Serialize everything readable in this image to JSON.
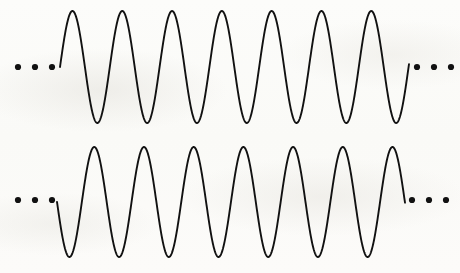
{
  "figure": {
    "background_color": "#fdfdfb",
    "stroke_color": "#111111",
    "stroke_width": 1.9,
    "width": 460,
    "height": 273
  },
  "chart_data": {
    "type": "line",
    "title": "",
    "subtitle": "",
    "xlabel": "",
    "ylabel": "",
    "xlim": [
      0,
      460
    ],
    "ylim": [
      273,
      0
    ],
    "grid": false,
    "legend": "none",
    "annotations": [
      {
        "name": "ellipsis-left-top",
        "text": "...",
        "dots": 3,
        "x": 18,
        "y": 67,
        "dot_radius": 3.1,
        "dot_spacing": 17
      },
      {
        "name": "ellipsis-right-top",
        "text": "...",
        "dots": 3,
        "x": 417,
        "y": 67,
        "dot_radius": 3.1,
        "dot_spacing": 17
      },
      {
        "name": "ellipsis-left-bottom",
        "text": "...",
        "dots": 3,
        "x": 18,
        "y": 200,
        "dot_radius": 3.1,
        "dot_spacing": 17
      },
      {
        "name": "ellipsis-right-bottom",
        "text": "...",
        "dots": 3,
        "x": 412,
        "y": 200,
        "dot_radius": 3.1,
        "dot_spacing": 17
      }
    ],
    "series": [
      {
        "name": "top-wave",
        "label": "Top sine wave",
        "waveform": "sine",
        "phase_degrees": 0,
        "cycles": 7,
        "peaks": 7,
        "troughs": 7,
        "x_start": 60,
        "x_end": 409,
        "period_px": 49.8,
        "midline_y": 67,
        "amplitude_px": 56,
        "peak_y": 11,
        "trough_y": 123,
        "starts_direction": "up",
        "peak_x_positions": [
          72,
          122,
          172,
          222,
          272,
          322,
          372
        ],
        "trough_x_positions": [
          97,
          147,
          197,
          247,
          297,
          347,
          397
        ]
      },
      {
        "name": "bottom-wave",
        "label": "Bottom sine wave",
        "waveform": "sine",
        "phase_degrees": 180,
        "cycles": 7,
        "peaks": 7,
        "troughs": 7,
        "x_start": 57,
        "x_end": 405,
        "period_px": 49.7,
        "midline_y": 202,
        "amplitude_px": 55,
        "peak_y": 147,
        "trough_y": 257,
        "starts_direction": "down",
        "peak_x_positions": [
          94,
          144,
          193,
          243,
          293,
          343,
          392
        ],
        "trough_x_positions": [
          69,
          119,
          169,
          218,
          268,
          318,
          368
        ]
      }
    ]
  }
}
